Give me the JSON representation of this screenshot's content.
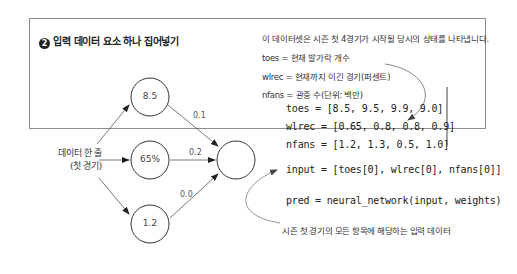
{
  "title": {
    "number": "2",
    "text": "입력 데이터 요소 하나 집어넣기"
  },
  "description": {
    "intro": "이 데이터셋은 시즌 첫 4경기가 시작될 당시의 상태를 나타냅니다.",
    "toes": "toes = 현재 발가락 개수",
    "wlrec": "wlrec = 현재까지 이긴 경기(퍼센트)",
    "nfans": "nfans = 관중 수(단위: 백만)"
  },
  "code": {
    "toes": "toes = [8.5, 9.5, 9.9, 9.0]",
    "wlrec": "wlrec = [0.65, 0.8, 0.8, 0.9]",
    "nfans": "nfans = [1.2, 1.3, 0.5, 1.0]",
    "input": "input = [toes[0], wlrec[0], nfans[0]]",
    "pred": "pred = neural_network(input, weights)"
  },
  "diagram": {
    "row_label_line1": "데이터 한 줄",
    "row_label_line2": "(첫 경기)",
    "nodes": [
      {
        "value": "8.5"
      },
      {
        "value": "65%"
      },
      {
        "value": "1.2"
      }
    ],
    "weights": [
      "0.1",
      "0.2",
      "0.0"
    ],
    "output_node": ""
  },
  "caption": "시즌 첫 경기의 모든 항목에 해당하는 입력 데이터",
  "colors": {
    "border": "#8c8c8c",
    "text": "#333333",
    "line": "#555555"
  }
}
